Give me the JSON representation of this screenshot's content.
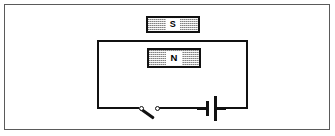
{
  "figure": {
    "width": 335,
    "height": 136,
    "background_color": "#ffffff",
    "frame_color": "#5a5a5a",
    "line_color": "#111111",
    "magnet_fill_color": "#b9b9b9"
  },
  "magnets": [
    {
      "id": "magnet-s",
      "label": "S",
      "position": "above-circuit-outside",
      "x": 146,
      "y": 16,
      "width": 54,
      "height": 17
    },
    {
      "id": "magnet-n",
      "label": "N",
      "position": "inside-circuit-loop",
      "x": 147,
      "y": 48,
      "width": 54,
      "height": 20
    }
  ],
  "circuit": {
    "loop": {
      "x": 97,
      "y": 40,
      "width": 151,
      "height": 69,
      "stroke_width": 2.5
    },
    "components": [
      {
        "id": "switch",
        "type": "knife-switch",
        "state": "open",
        "x": 139,
        "y": 105
      },
      {
        "id": "battery",
        "type": "cell",
        "x": 206,
        "y": 96
      }
    ]
  }
}
